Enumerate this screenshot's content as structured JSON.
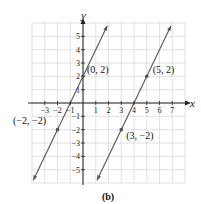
{
  "chart_data": {
    "type": "line",
    "title": "",
    "caption": "(b)",
    "xlabel": "x",
    "ylabel": "y",
    "xlim": [
      -4,
      8
    ],
    "ylim": [
      -6,
      6
    ],
    "grid": true,
    "x_ticks": [
      -3,
      -2,
      -1,
      1,
      2,
      3,
      4,
      5,
      6,
      7
    ],
    "x_tick_labels": [
      "−3",
      "−2",
      "−1",
      "1",
      "2",
      "3",
      "4",
      "5",
      "6",
      "7"
    ],
    "y_ticks": [
      5,
      4,
      3,
      2,
      1,
      -1,
      -2,
      -3,
      -4,
      -5
    ],
    "y_tick_labels": [
      "5",
      "4",
      "3",
      "2",
      "1",
      "−1",
      "−2",
      "−3",
      "−4",
      "−5"
    ],
    "series": [
      {
        "name": "line through (-2,-2) and (0,2)",
        "equation": "y = 2x + 2",
        "x": [
          -2,
          0
        ],
        "y": [
          -2,
          2
        ],
        "labels": [
          "(−2, −2)",
          "(0, 2)"
        ]
      },
      {
        "name": "line through (3,-2) and (5,2)",
        "equation": "y = 2x - 8",
        "x": [
          3,
          5
        ],
        "y": [
          -2,
          2
        ],
        "labels": [
          "(3, −2)",
          "(5, 2)"
        ]
      }
    ]
  }
}
